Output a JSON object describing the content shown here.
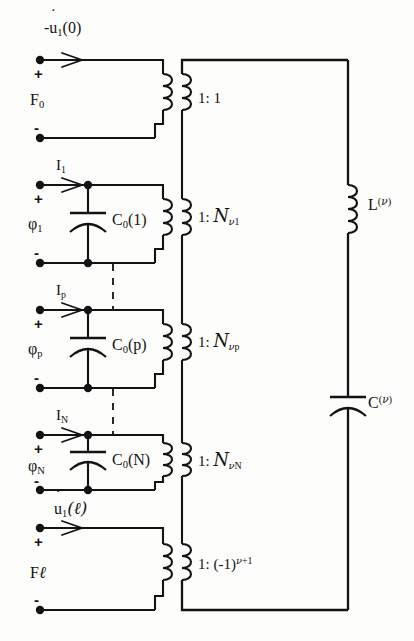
{
  "figure": {
    "type": "circuit-diagram",
    "title": "",
    "width": 414,
    "height": 641,
    "line_color": "#131313",
    "background": "#fdfdfc"
  },
  "left_ports": [
    {
      "id": "port-f0",
      "name": "F",
      "name_sub": "0",
      "flow_label_prefix": "-",
      "flow_label_base": "u",
      "flow_label_sub": "1",
      "flow_label_arg": "(0)",
      "plus": "+",
      "minus": "-",
      "has_capacitor": false,
      "capacitor": "",
      "ratio_lead": "1:",
      "ratio_value": "1"
    },
    {
      "id": "port-phi1",
      "name": "φ",
      "name_sub": "1",
      "flow_label_base": "I",
      "flow_label_sub": "1",
      "plus": "+",
      "minus": "-",
      "has_capacitor": true,
      "capacitor_base": "C",
      "capacitor_sub": "0",
      "capacitor_arg": "(1)",
      "ratio_lead": "1:",
      "ratio_script": "N",
      "ratio_sub_nu": "ν",
      "ratio_sub_idx": "1"
    },
    {
      "id": "port-phip",
      "name": "φ",
      "name_sub": "p",
      "flow_label_base": "I",
      "flow_label_sub": "p",
      "plus": "+",
      "minus": "-",
      "has_capacitor": true,
      "capacitor_base": "C",
      "capacitor_sub": "0",
      "capacitor_arg": "(p)",
      "ratio_lead": "1:",
      "ratio_script": "N",
      "ratio_sub_nu": "ν",
      "ratio_sub_idx": "p"
    },
    {
      "id": "port-phiN",
      "name": "φ",
      "name_sub": "N",
      "flow_label_base": "I",
      "flow_label_sub": "N",
      "plus": "+",
      "minus": "-",
      "has_capacitor": true,
      "capacitor_base": "C",
      "capacitor_sub": "0",
      "capacitor_arg": "(N)",
      "ratio_lead": "1:",
      "ratio_script": "N",
      "ratio_sub_nu": "ν",
      "ratio_sub_idx": "N"
    },
    {
      "id": "port-fl",
      "name": "F",
      "name_sub": "ℓ",
      "flow_label_base": "u",
      "flow_label_sub": "1",
      "flow_label_arg": "(ℓ)",
      "plus": "+",
      "minus": "-",
      "has_capacitor": false,
      "capacitor": "",
      "ratio_lead": "1:",
      "ratio_value_open": "(-1)",
      "ratio_value_exp_nu": "ν",
      "ratio_value_exp_rest": "+1"
    }
  ],
  "right_branch": {
    "inductor": {
      "base": "L",
      "sup_nu": "ν"
    },
    "capacitor": {
      "base": "C",
      "sup_nu": "ν"
    }
  },
  "icons": {
    "terminal": "terminal-dot",
    "arrow": "current-arrow",
    "coil": "inductor-coil",
    "cap": "capacitor-plates",
    "dashed": "dashed-continuation"
  }
}
